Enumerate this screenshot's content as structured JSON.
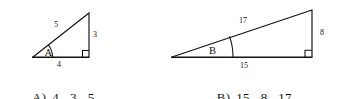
{
  "figure": {
    "stroke_color": "#111111",
    "background_color": "#ffffff",
    "triangle_a": {
      "angle_label": "A",
      "hypotenuse_label": "5",
      "vertical_leg_label": "3",
      "horizontal_leg_label": "4",
      "right_angle_marker": "square",
      "vertices": {
        "left": [
          33,
          57
        ],
        "bottom_right": [
          89,
          57
        ],
        "apex": [
          89,
          13
        ]
      }
    },
    "triangle_b": {
      "angle_label": "B",
      "hypotenuse_label": "17",
      "vertical_leg_label": "8",
      "horizontal_leg_label": "15",
      "right_angle_marker": "square",
      "vertices": {
        "left": [
          172,
          57
        ],
        "bottom_right": [
          312,
          57
        ],
        "apex": [
          312,
          10
        ]
      }
    }
  },
  "answers": {
    "a": {
      "letter": "A)",
      "values": [
        "4",
        "3",
        "5"
      ]
    },
    "b": {
      "letter": "B)",
      "values": [
        "15",
        "8",
        "17"
      ]
    }
  }
}
